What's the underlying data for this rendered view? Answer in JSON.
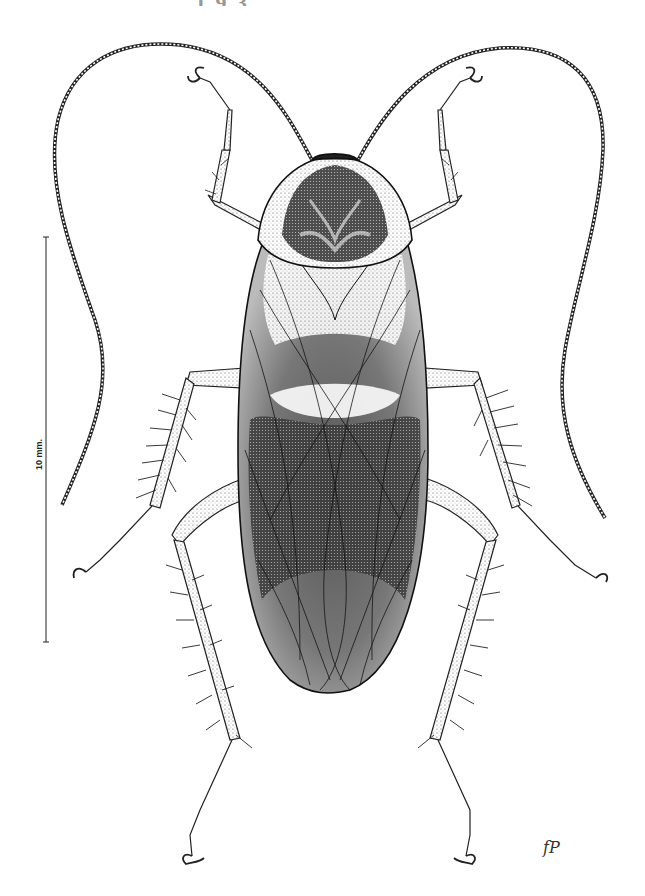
{
  "figure": {
    "header_fragment": "... ...................., 1 9 3.",
    "scale_bar": {
      "label": "10 mm.",
      "orientation": "vertical"
    },
    "signature": "fP"
  },
  "colors": {
    "ink": "#1a1a1a",
    "shade": "#3a3a3a",
    "paper": "#ffffff",
    "light_fill": "#f2f2f2",
    "mid_fill": "#8a8a8a",
    "dark_fill": "#2b2b2b"
  }
}
